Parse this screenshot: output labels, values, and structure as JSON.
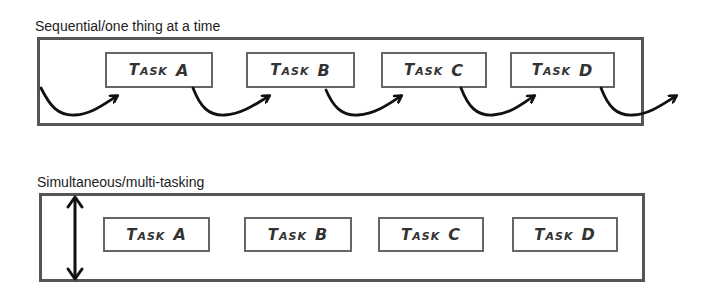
{
  "sequential": {
    "heading": "Sequential/one thing at a time",
    "tasks": [
      {
        "word": "Task",
        "letter": "A"
      },
      {
        "word": "Task",
        "letter": "B"
      },
      {
        "word": "Task",
        "letter": "C"
      },
      {
        "word": "Task",
        "letter": "D"
      }
    ],
    "arrow_icon": "curved-arrow-icon"
  },
  "simultaneous": {
    "heading": "Simultaneous/multi-tasking",
    "tasks": [
      {
        "word": "Task",
        "letter": "A"
      },
      {
        "word": "Task",
        "letter": "B"
      },
      {
        "word": "Task",
        "letter": "C"
      },
      {
        "word": "Task",
        "letter": "D"
      }
    ],
    "arrow_icon": "double-headed-vertical-arrow-icon"
  },
  "colors": {
    "frame_border": "#555555",
    "task_border": "#666666",
    "arrow": "#111111",
    "text": "#222222"
  }
}
